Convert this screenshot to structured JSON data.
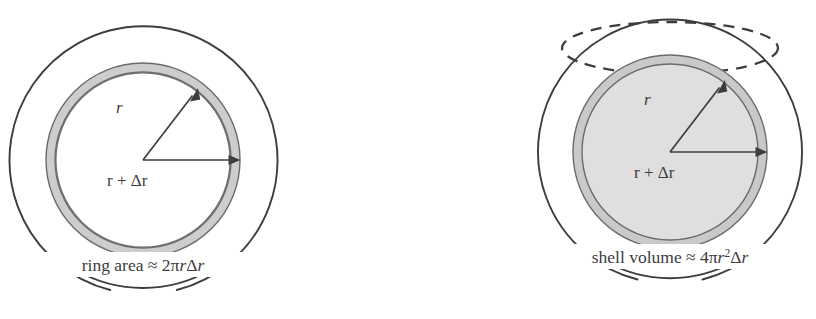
{
  "figure": {
    "background_color": "#ffffff",
    "ink_color": "#3d3c3e",
    "band_color": "#cfcdcb",
    "sphere_fill_color": "#e0dfdd",
    "width": 816,
    "height": 319
  },
  "panels": [
    {
      "id": "ring",
      "name": "ring-diagram",
      "caption": {
        "prefix": "ring area",
        "approx_symbol": "≈",
        "coefficient": "2",
        "pi": "π",
        "radius_symbol": "r",
        "delta": "Δ",
        "full_text": "ring area ≈ 2πrΔr"
      },
      "labels": {
        "inner_radius": "r",
        "outer_radius": "r + Δr"
      },
      "geometry": {
        "center_x": 143,
        "center_y": 160,
        "outer_circle_radius": 134,
        "band_outer_radius": 97,
        "band_inner_radius": 88,
        "inner_radius_arrow_length": 84,
        "inner_radius_arrow_angle_deg": 52,
        "outer_radius_arrow_length": 97
      }
    },
    {
      "id": "shell",
      "name": "shell-diagram",
      "caption": {
        "prefix": "shell volume",
        "approx_symbol": "≈",
        "coefficient": "4",
        "pi": "π",
        "radius_symbol": "r",
        "exponent": "2",
        "delta": "Δ",
        "full_text": "shell volume ≈ 4πr²Δr"
      },
      "labels": {
        "inner_radius": "r",
        "outer_radius": "r + Δr"
      },
      "geometry": {
        "center_x": 262,
        "center_y": 152,
        "outer_sphere_radius": 132,
        "shell_outer_radius": 97,
        "shell_inner_radius": 88,
        "equator_ellipse_rx": 108,
        "equator_ellipse_ry": 26,
        "equator_center_y": 48,
        "inner_radius_arrow_length": 84,
        "inner_radius_arrow_angle_deg": 52,
        "outer_radius_arrow_length": 97
      }
    }
  ]
}
